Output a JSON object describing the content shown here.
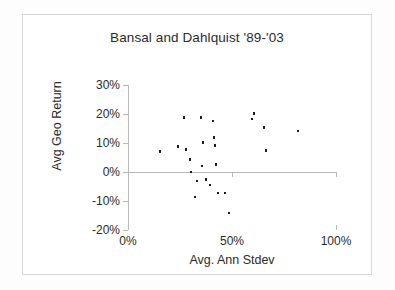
{
  "chart_data": {
    "type": "scatter",
    "title": "Bansal and Dahlquist '89-'03",
    "xlabel": "Avg. Ann Stdev",
    "ylabel": "Avg Geo Return",
    "xlim": [
      0,
      100
    ],
    "ylim": [
      -20,
      30
    ],
    "xticks": [
      "0%",
      "50%",
      "100%"
    ],
    "xtick_values": [
      0,
      50,
      100
    ],
    "yticks": [
      "30%",
      "20%",
      "10%",
      "0%",
      "-10%",
      "-20%"
    ],
    "ytick_values": [
      30,
      20,
      10,
      0,
      -10,
      -20
    ],
    "grid": false,
    "legend": "none",
    "marker_color": "#1c1c1c",
    "points": [
      {
        "x": 15.4,
        "y": 7.0
      },
      {
        "x": 24.0,
        "y": 8.8
      },
      {
        "x": 27.0,
        "y": 18.8
      },
      {
        "x": 27.9,
        "y": 7.7
      },
      {
        "x": 29.8,
        "y": 4.3
      },
      {
        "x": 30.3,
        "y": 0.0
      },
      {
        "x": 32.2,
        "y": -8.6
      },
      {
        "x": 33.2,
        "y": -3.1
      },
      {
        "x": 35.1,
        "y": 18.7
      },
      {
        "x": 35.6,
        "y": 2.1
      },
      {
        "x": 36.1,
        "y": 10.2
      },
      {
        "x": 37.5,
        "y": -2.6
      },
      {
        "x": 39.4,
        "y": -4.5
      },
      {
        "x": 40.9,
        "y": 17.6
      },
      {
        "x": 41.3,
        "y": 11.9
      },
      {
        "x": 41.8,
        "y": 9.1
      },
      {
        "x": 42.3,
        "y": 2.6
      },
      {
        "x": 43.3,
        "y": -7.2
      },
      {
        "x": 46.6,
        "y": -7.2
      },
      {
        "x": 48.6,
        "y": -14.2
      },
      {
        "x": 59.6,
        "y": 18.3
      },
      {
        "x": 60.6,
        "y": 20.1
      },
      {
        "x": 65.4,
        "y": 15.3
      },
      {
        "x": 66.3,
        "y": 7.5
      },
      {
        "x": 81.7,
        "y": 14.2
      }
    ]
  }
}
